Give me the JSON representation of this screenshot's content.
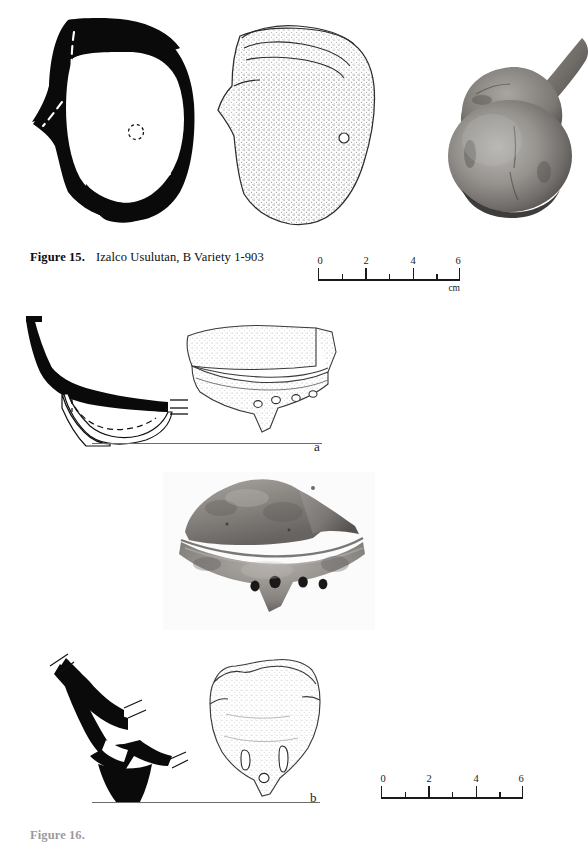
{
  "figure": {
    "caption_number": "Figure 15.",
    "caption_text": "Izalco Usulutan, B Variety 1-903",
    "bottom_caption_number": "Figure 16.",
    "bottom_caption_text": ""
  },
  "specimen_labels": {
    "a": "a",
    "b": "b"
  },
  "scale_top": {
    "ticks": [
      "0",
      "2",
      "4",
      "6"
    ],
    "unit": "cm",
    "min": 0,
    "max": 6,
    "step_major": 2,
    "step_minor": 1
  },
  "scale_bottom": {
    "ticks": [
      "0",
      "2",
      "4",
      "6"
    ],
    "unit": "",
    "min": 0,
    "max": 6,
    "step_major": 2,
    "step_minor": 1
  },
  "illustrations": {
    "top_section": {
      "name": "vessel-cross-section-profile",
      "style": "solid-black-fill-with-dashed-interior-lines",
      "has_dashed_lines": true,
      "has_small_dashed_circle": true
    },
    "top_stipple": {
      "name": "vessel-sherd-stipple-drawing",
      "style": "stippled-line-drawing",
      "has_perforation": true,
      "perforation_count": 1
    },
    "top_photo": {
      "name": "vessel-photograph",
      "style": "grayscale-photograph",
      "subject": "globular vessel with spout"
    },
    "mid_section_a": {
      "name": "support-cross-section-profile-a",
      "style": "solid-black-fill-with-dashed-interior-lines",
      "has_baseline": true
    },
    "mid_stipple_a": {
      "name": "support-stipple-drawing-a",
      "style": "stippled-line-drawing",
      "perforation_count": 4
    },
    "mid_photo": {
      "name": "support-photograph",
      "style": "grayscale-photograph",
      "perforation_count": 4
    },
    "bottom_section_b": {
      "name": "support-cross-section-profile-b",
      "style": "solid-black-fill",
      "has_baseline": true
    },
    "bottom_stipple_b": {
      "name": "support-stipple-drawing-b",
      "style": "stippled-line-drawing",
      "perforation_count": 3
    }
  },
  "colors": {
    "ink": "#111111",
    "rule": "#6b6b6b",
    "stipple": "#8a8a8a",
    "outline": "#2b2b2b",
    "paper": "#ffffff"
  }
}
